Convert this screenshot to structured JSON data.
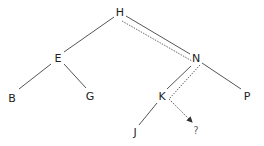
{
  "diagram": {
    "type": "binary-search-tree",
    "nodes": [
      {
        "id": "H",
        "label": "H",
        "x": 120,
        "y": 12
      },
      {
        "id": "E",
        "label": "E",
        "x": 58,
        "y": 58
      },
      {
        "id": "N",
        "label": "N",
        "x": 196,
        "y": 58
      },
      {
        "id": "B",
        "label": "B",
        "x": 12,
        "y": 98
      },
      {
        "id": "G",
        "label": "G",
        "x": 90,
        "y": 96
      },
      {
        "id": "K",
        "label": "K",
        "x": 162,
        "y": 96
      },
      {
        "id": "P",
        "label": "P",
        "x": 247,
        "y": 96
      },
      {
        "id": "J",
        "label": "J",
        "x": 135,
        "y": 132
      },
      {
        "id": "Q",
        "label": "?",
        "x": 196,
        "y": 131
      }
    ],
    "edges": [
      {
        "from": "H",
        "to": "E"
      },
      {
        "from": "H",
        "to": "N"
      },
      {
        "from": "E",
        "to": "B"
      },
      {
        "from": "E",
        "to": "G"
      },
      {
        "from": "N",
        "to": "K"
      },
      {
        "from": "N",
        "to": "P"
      },
      {
        "from": "K",
        "to": "J"
      }
    ],
    "search_path": [
      "H",
      "N",
      "K",
      "?"
    ],
    "search_path_style": "dotted-arrow"
  }
}
